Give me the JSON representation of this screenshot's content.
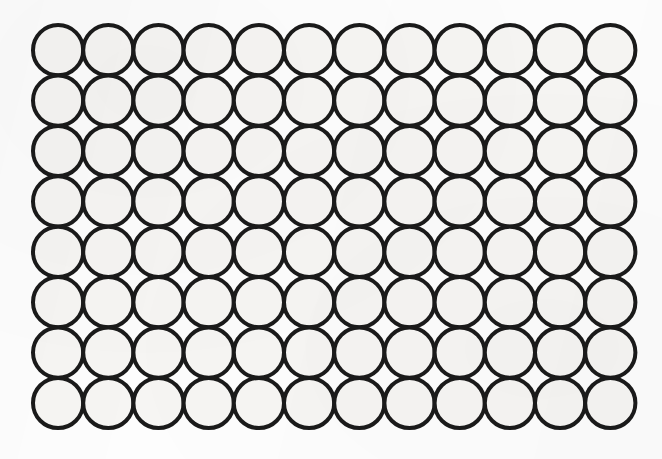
{
  "figure": {
    "medium": "scanned printed line drawing",
    "canvas": {
      "width": 662,
      "height": 459,
      "background_color": "#fdfdfd"
    },
    "style": {
      "stroke_color": "#1a1a1a",
      "stroke_width": 4,
      "fill_color": "#f6f5f3",
      "packing": "square",
      "tangency": "externally tangent"
    }
  },
  "chart_data": {
    "type": "scatter",
    "xlabel": "",
    "ylabel": "",
    "columns": 12,
    "rows": 8,
    "total_circles": 96,
    "radius": 25.1,
    "diameter": 50.2,
    "pitch_x": 50.2,
    "pitch_y": 50.4,
    "first_center_x": 58.1,
    "first_center_y": 50.2,
    "xlim": [
      33,
      635
    ],
    "ylim": [
      25,
      428
    ],
    "grid": false,
    "legend": false,
    "column_centers_x": [
      58.1,
      108.3,
      158.5,
      208.7,
      258.9,
      309.1,
      359.3,
      409.5,
      459.7,
      509.9,
      560.1,
      610.3
    ],
    "row_centers_y": [
      50.2,
      100.6,
      151.0,
      201.4,
      251.8,
      302.2,
      352.6,
      403.0
    ]
  }
}
